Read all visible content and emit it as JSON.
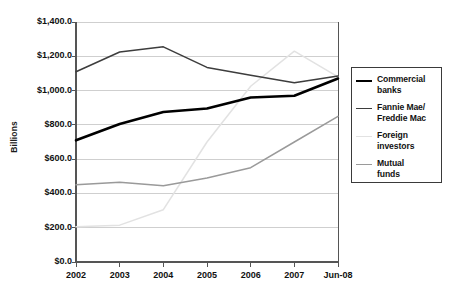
{
  "chart_data": {
    "type": "line",
    "title": "",
    "xlabel": "",
    "ylabel": "Billions",
    "categories": [
      "2002",
      "2003",
      "2004",
      "2005",
      "2006",
      "2007",
      "Jun-08"
    ],
    "ylim": [
      0,
      1400
    ],
    "ytick_values": [
      0,
      200,
      400,
      600,
      800,
      1000,
      1200,
      1400
    ],
    "ytick_labels": [
      "$0.0",
      "$200.0",
      "$400.0",
      "$600.0",
      "$800.0",
      "$1,000.0",
      "$1,200.0",
      "$1,400.0"
    ],
    "grid": true,
    "legend_position": "right",
    "units": "Billions of dollars",
    "series": [
      {
        "name": "Commercial banks",
        "color": "#000000",
        "width": 2.6,
        "values": [
          710,
          805,
          875,
          895,
          960,
          970,
          1070
        ]
      },
      {
        "name": "Fannie Mae/ Freddie Mac",
        "color": "#3d3d3d",
        "width": 1.5,
        "values": [
          1110,
          1225,
          1255,
          1135,
          1090,
          1045,
          1085
        ]
      },
      {
        "name": "Foreign investors",
        "color": "#e2e2e2",
        "width": 1.5,
        "values": [
          205,
          215,
          305,
          700,
          1025,
          1230,
          1080
        ]
      },
      {
        "name": "Mutual funds",
        "color": "#9a9a9a",
        "width": 1.5,
        "values": [
          450,
          465,
          445,
          490,
          550,
          700,
          850
        ]
      }
    ]
  },
  "legend": {
    "entries": [
      {
        "label_line1": "Commercial",
        "label_line2": "banks"
      },
      {
        "label_line1": "Fannie Mae/",
        "label_line2": "Freddie Mac"
      },
      {
        "label_line1": "Foreign",
        "label_line2": "investors"
      },
      {
        "label_line1": "Mutual",
        "label_line2": "funds"
      }
    ]
  },
  "axes": {
    "y_title": "Billions",
    "axis_color": "#555555",
    "grid_color": "#cfcfcf"
  }
}
